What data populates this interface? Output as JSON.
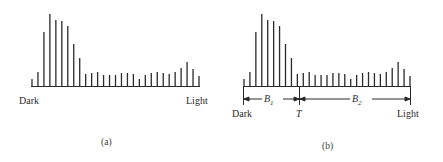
{
  "chart_data": [
    {
      "type": "bar",
      "panel": "(a)",
      "title": "",
      "xlabel_left": "Dark",
      "xlabel_right": "Light",
      "bar_heights_px": [
        7,
        14,
        54,
        72,
        66,
        65,
        60,
        42,
        28,
        12,
        13,
        14,
        11,
        11,
        11,
        13,
        13,
        12,
        7,
        11,
        13,
        14,
        13,
        12,
        14,
        18,
        24,
        17,
        10
      ]
    },
    {
      "type": "bar",
      "panel": "(b)",
      "title": "",
      "xlabel_left": "Dark",
      "xlabel_right": "Light",
      "threshold_label": "T",
      "class_labels": [
        "B1",
        "B2"
      ],
      "bar_heights_px": [
        7,
        14,
        54,
        72,
        66,
        65,
        60,
        42,
        28,
        12,
        13,
        14,
        11,
        11,
        11,
        13,
        13,
        12,
        7,
        11,
        13,
        14,
        13,
        12,
        14,
        18,
        24,
        17,
        10
      ]
    }
  ],
  "panel_a": {
    "left_label": "Dark",
    "right_label": "Light",
    "caption": "(a)"
  },
  "panel_b": {
    "left_label": "Dark",
    "right_label": "Light",
    "threshold": "T",
    "b1_main": "B",
    "b1_sub": "1",
    "b2_main": "B",
    "b2_sub": "2",
    "caption": "(b)"
  },
  "colors": {
    "ink": "#2a2a2a",
    "background": "#ffffff"
  }
}
